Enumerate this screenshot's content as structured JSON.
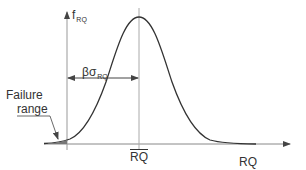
{
  "diagram": {
    "type": "probability-density-curve",
    "y_axis": {
      "label_main": "f",
      "label_sub": "RQ"
    },
    "x_axis": {
      "label": "RQ"
    },
    "mean_marker": {
      "label": "RQ",
      "overlined": true
    },
    "distance_annotation": {
      "label_main": "βσ",
      "label_sub": "RQ"
    },
    "failure_annotation": {
      "line1": "Failure",
      "line2": "range"
    },
    "colors": {
      "line": "#333333",
      "axis": "#888888",
      "text": "#333333"
    }
  }
}
